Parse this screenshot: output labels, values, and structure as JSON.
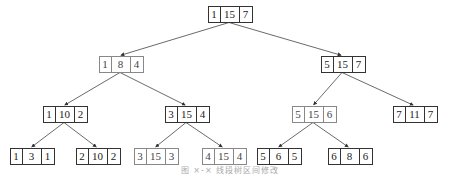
{
  "diagram": {
    "type": "tree",
    "nodes": [
      {
        "id": "n1",
        "values": [
          "1",
          "15",
          "7"
        ],
        "x": 229,
        "y": 14,
        "style": "dark"
      },
      {
        "id": "n2",
        "values": [
          "1",
          "8",
          "4"
        ],
        "x": 120,
        "y": 64,
        "style": "light"
      },
      {
        "id": "n3",
        "values": [
          "5",
          "15",
          "7"
        ],
        "x": 342,
        "y": 64,
        "style": "dark"
      },
      {
        "id": "n4",
        "values": [
          "1",
          "10",
          "2"
        ],
        "x": 64,
        "y": 114,
        "style": "dark"
      },
      {
        "id": "n5",
        "values": [
          "3",
          "15",
          "4"
        ],
        "x": 186,
        "y": 114,
        "style": "dark"
      },
      {
        "id": "n6",
        "values": [
          "5",
          "15",
          "6"
        ],
        "x": 313,
        "y": 114,
        "style": "light"
      },
      {
        "id": "n7",
        "values": [
          "7",
          "11",
          "7"
        ],
        "x": 414,
        "y": 114,
        "style": "dark"
      },
      {
        "id": "n8",
        "values": [
          "1",
          "3",
          "1"
        ],
        "x": 31,
        "y": 156,
        "style": "dark"
      },
      {
        "id": "n9",
        "values": [
          "2",
          "10",
          "2"
        ],
        "x": 97,
        "y": 156,
        "style": "dark"
      },
      {
        "id": "n10",
        "values": [
          "3",
          "15",
          "3"
        ],
        "x": 155,
        "y": 156,
        "style": "light"
      },
      {
        "id": "n11",
        "values": [
          "4",
          "15",
          "4"
        ],
        "x": 223,
        "y": 156,
        "style": "light"
      },
      {
        "id": "n12",
        "values": [
          "5",
          "6",
          "5"
        ],
        "x": 278,
        "y": 156,
        "style": "dark"
      },
      {
        "id": "n13",
        "values": [
          "6",
          "8",
          "6"
        ],
        "x": 349,
        "y": 156,
        "style": "dark"
      }
    ],
    "edges": [
      [
        "n1",
        "n2"
      ],
      [
        "n1",
        "n3"
      ],
      [
        "n2",
        "n4"
      ],
      [
        "n2",
        "n5"
      ],
      [
        "n3",
        "n6"
      ],
      [
        "n3",
        "n7"
      ],
      [
        "n4",
        "n8"
      ],
      [
        "n4",
        "n9"
      ],
      [
        "n5",
        "n10"
      ],
      [
        "n5",
        "n11"
      ],
      [
        "n6",
        "n12"
      ],
      [
        "n6",
        "n13"
      ]
    ]
  },
  "caption": "图 ×-×  线段树区间修改"
}
